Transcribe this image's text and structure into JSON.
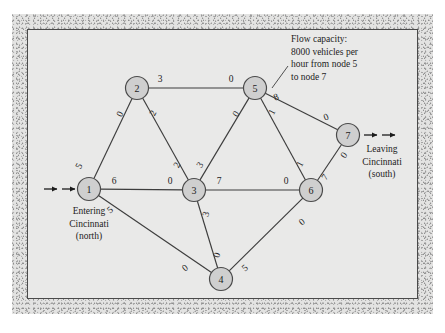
{
  "figure": {
    "background_color": "#e9e9e8",
    "frame_color": "#e3e3e2",
    "node_fill": "#cfcfcf",
    "line_color": "#3d3d3d"
  },
  "nodes": [
    {
      "id": "1",
      "label": "1",
      "x": 89,
      "y": 189
    },
    {
      "id": "2",
      "label": "2",
      "x": 137,
      "y": 88
    },
    {
      "id": "3",
      "label": "3",
      "x": 194,
      "y": 190
    },
    {
      "id": "4",
      "label": "4",
      "x": 221,
      "y": 279
    },
    {
      "id": "5",
      "label": "5",
      "x": 255,
      "y": 88
    },
    {
      "id": "6",
      "label": "6",
      "x": 311,
      "y": 190
    },
    {
      "id": "7",
      "label": "7",
      "x": 348,
      "y": 135
    }
  ],
  "edges": [
    {
      "id": "e-1-2",
      "from": "1",
      "to": "2",
      "label_from": "5",
      "label_to": "0",
      "lx_from": 79,
      "ly_from": 166,
      "lx_to": 120,
      "ly_to": 114,
      "rot_from": -62,
      "rot_to": -62
    },
    {
      "id": "e-2-5",
      "from": "2",
      "to": "5",
      "label_from": "3",
      "label_to": "0",
      "lx_from": 160,
      "ly_from": 79,
      "lx_to": 231,
      "ly_to": 79,
      "rot_from": 0,
      "rot_to": 0
    },
    {
      "id": "e-2-3",
      "from": "2",
      "to": "3",
      "label_from": "2",
      "label_to": "2",
      "lx_from": 153,
      "ly_from": 113,
      "lx_to": 177,
      "ly_to": 165,
      "rot_from": -62,
      "rot_to": -62
    },
    {
      "id": "e-1-3",
      "from": "1",
      "to": "3",
      "label_from": "6",
      "label_to": "0",
      "lx_from": 114,
      "ly_from": 181,
      "lx_to": 170,
      "ly_to": 181,
      "rot_from": 0,
      "rot_to": 0
    },
    {
      "id": "e-1-4",
      "from": "1",
      "to": "4",
      "label_from": "5",
      "label_to": "0",
      "lx_from": 110,
      "ly_from": 210,
      "lx_to": 185,
      "ly_to": 268,
      "rot_from": -38,
      "rot_to": -38
    },
    {
      "id": "e-3-5",
      "from": "3",
      "to": "5",
      "label_from": "3",
      "label_to": "0",
      "lx_from": 200,
      "ly_from": 165,
      "lx_to": 236,
      "ly_to": 114,
      "rot_from": -58,
      "rot_to": -58
    },
    {
      "id": "e-3-6",
      "from": "3",
      "to": "6",
      "label_from": "7",
      "label_to": "0",
      "lx_from": 219,
      "ly_from": 181,
      "lx_to": 286,
      "ly_to": 181,
      "rot_from": 0,
      "rot_to": 0
    },
    {
      "id": "e-3-4",
      "from": "3",
      "to": "4",
      "label_from": "3",
      "label_to": "0",
      "lx_from": 206,
      "ly_from": 214,
      "lx_to": 217,
      "ly_to": 255,
      "rot_from": -72,
      "rot_to": -72
    },
    {
      "id": "e-5-6",
      "from": "5",
      "to": "6",
      "label_from": "1",
      "label_to": "1",
      "lx_from": 272,
      "ly_from": 112,
      "lx_to": 300,
      "ly_to": 164,
      "rot_from": -62,
      "rot_to": -62
    },
    {
      "id": "e-5-7",
      "from": "5",
      "to": "7",
      "label_from": "8",
      "label_to": "0",
      "lx_from": 276,
      "ly_from": 97,
      "lx_to": 326,
      "ly_to": 117,
      "rot_from": -22,
      "rot_to": -22
    },
    {
      "id": "e-6-7",
      "from": "6",
      "to": "7",
      "label_from": "7",
      "label_to": "0",
      "lx_from": 325,
      "ly_from": 177,
      "lx_to": 344,
      "ly_to": 155,
      "rot_from": -55,
      "rot_to": -55
    },
    {
      "id": "e-4-6",
      "from": "4",
      "to": "6",
      "label_from": "5",
      "label_to": "0",
      "lx_from": 245,
      "ly_from": 268,
      "lx_to": 302,
      "ly_to": 222,
      "rot_from": -40,
      "rot_to": -40
    }
  ],
  "annotation": {
    "id": "flow-capacity-note",
    "lines": [
      "Flow capacity:",
      "8000 vehicles per",
      "hour from node 5",
      "to node 7"
    ],
    "x": 291,
    "y": 42,
    "line_height": 12.5,
    "leader": {
      "x1": 288,
      "y1": 66,
      "x2": 272,
      "y2": 88
    }
  },
  "captions": {
    "entering": {
      "id": "entering-caption",
      "lines": [
        "Entering",
        "Cincinnati",
        "(north)"
      ],
      "x": 89,
      "y": 214,
      "line_height": 12.5
    },
    "leaving": {
      "id": "leaving-caption",
      "lines": [
        "Leaving",
        "Cincinnati",
        "(south)"
      ],
      "x": 382,
      "y": 152,
      "line_height": 12.5
    }
  },
  "flow_arrows": {
    "entering": [
      {
        "x1": 44,
        "y1": 189,
        "x2": 57,
        "y2": 189
      },
      {
        "x1": 62,
        "y1": 189,
        "x2": 75,
        "y2": 189
      }
    ],
    "leaving": [
      {
        "x1": 364,
        "y1": 135,
        "x2": 377,
        "y2": 135
      },
      {
        "x1": 382,
        "y1": 135,
        "x2": 395,
        "y2": 135
      }
    ]
  },
  "chart_data": {
    "type": "diagram",
    "subtype": "network-flow-graph",
    "nodes": [
      "1",
      "2",
      "3",
      "4",
      "5",
      "6",
      "7"
    ],
    "source": "1",
    "sink": "7",
    "edges": [
      {
        "from": "1",
        "to": "2",
        "capacity_from": 5,
        "capacity_to": 0
      },
      {
        "from": "2",
        "to": "5",
        "capacity_from": 3,
        "capacity_to": 0
      },
      {
        "from": "2",
        "to": "3",
        "capacity_from": 2,
        "capacity_to": 2
      },
      {
        "from": "1",
        "to": "3",
        "capacity_from": 6,
        "capacity_to": 0
      },
      {
        "from": "1",
        "to": "4",
        "capacity_from": 5,
        "capacity_to": 0
      },
      {
        "from": "3",
        "to": "5",
        "capacity_from": 3,
        "capacity_to": 0
      },
      {
        "from": "3",
        "to": "6",
        "capacity_from": 7,
        "capacity_to": 0
      },
      {
        "from": "3",
        "to": "4",
        "capacity_from": 3,
        "capacity_to": 0
      },
      {
        "from": "5",
        "to": "6",
        "capacity_from": 1,
        "capacity_to": 1
      },
      {
        "from": "5",
        "to": "7",
        "capacity_from": 8,
        "capacity_to": 0
      },
      {
        "from": "6",
        "to": "7",
        "capacity_from": 7,
        "capacity_to": 0
      },
      {
        "from": "4",
        "to": "6",
        "capacity_from": 5,
        "capacity_to": 0
      }
    ],
    "units": "thousands of vehicles per hour",
    "annotations": [
      "Flow capacity: 8000 vehicles per hour from node 5 to node 7"
    ]
  }
}
